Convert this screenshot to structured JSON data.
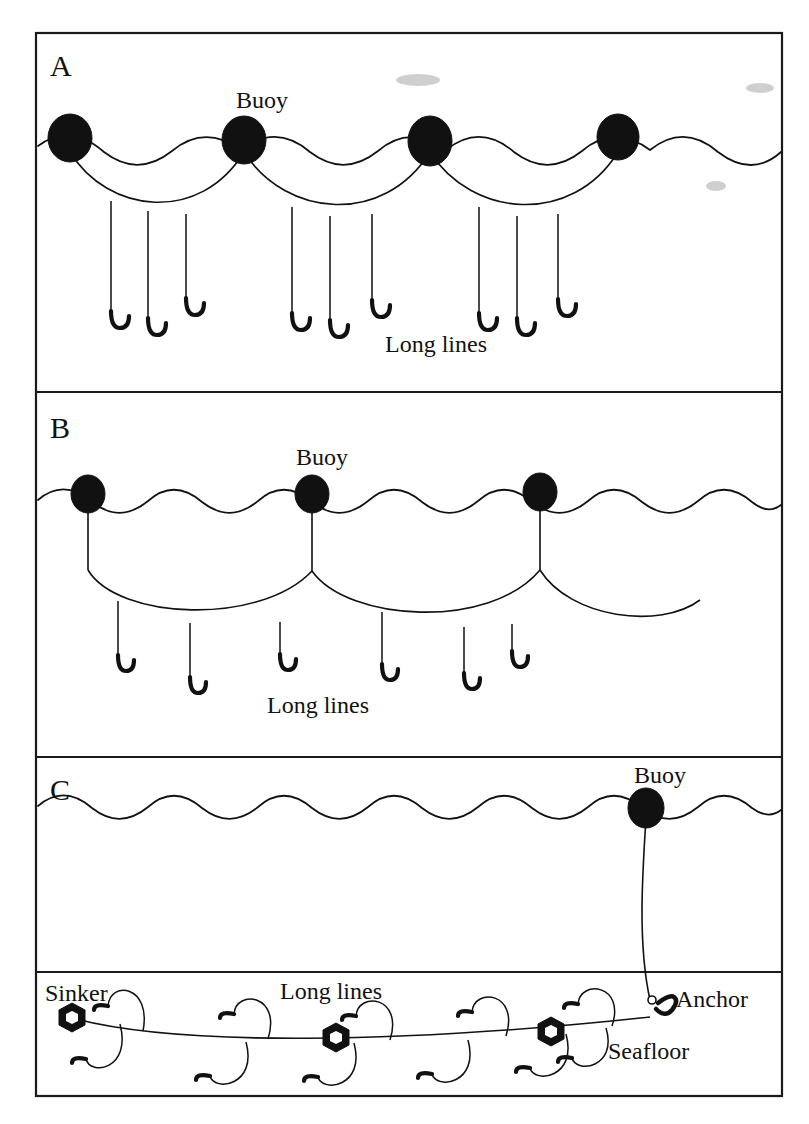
{
  "figure": {
    "background": "#ffffff",
    "ink_color": "#111111",
    "width": 809,
    "height": 1124
  },
  "panels": [
    {
      "id": "A",
      "letter": "A",
      "description": "Surface longline with four buoys and catenary mainline carrying short branch lines with J-hooks",
      "labels": [
        {
          "name": "buoy",
          "text": "Buoy",
          "x": 262,
          "y": 108
        },
        {
          "name": "long-lines",
          "text": "Long lines",
          "x": 380,
          "y": 352
        }
      ],
      "buoy_count": 4,
      "hook_count": 9
    },
    {
      "id": "B",
      "letter": "B",
      "description": "Longline suspended below surface by three buoys with vertical drop lines and branch lines with J-hooks",
      "labels": [
        {
          "name": "buoy",
          "text": "Buoy",
          "x": 292,
          "y": 465
        },
        {
          "name": "long-lines",
          "text": "Long lines",
          "x": 258,
          "y": 713
        }
      ],
      "buoy_count": 3,
      "hook_count": 6
    },
    {
      "id": "C",
      "letter": "C",
      "description": "Bottom-set demersal longline: single surface buoy with long vertical line to an anchor on the seafloor; mainline along seafloor with sinkers and branch lines with J-hooks",
      "labels": [
        {
          "name": "buoy",
          "text": "Buoy",
          "x": 662,
          "y": 783
        },
        {
          "name": "sinker",
          "text": "Sinker",
          "x": 45,
          "y": 1000
        },
        {
          "name": "long-lines",
          "text": "Long lines",
          "x": 280,
          "y": 999
        },
        {
          "name": "anchor",
          "text": "Anchor",
          "x": 676,
          "y": 1005
        },
        {
          "name": "seafloor",
          "text": "Seafloor",
          "x": 608,
          "y": 1058
        }
      ],
      "buoy_count": 1,
      "sinker_count": 3,
      "hook_count": 12
    }
  ],
  "legend_terms": [
    "Buoy",
    "Long lines",
    "Sinker",
    "Anchor",
    "Seafloor"
  ]
}
